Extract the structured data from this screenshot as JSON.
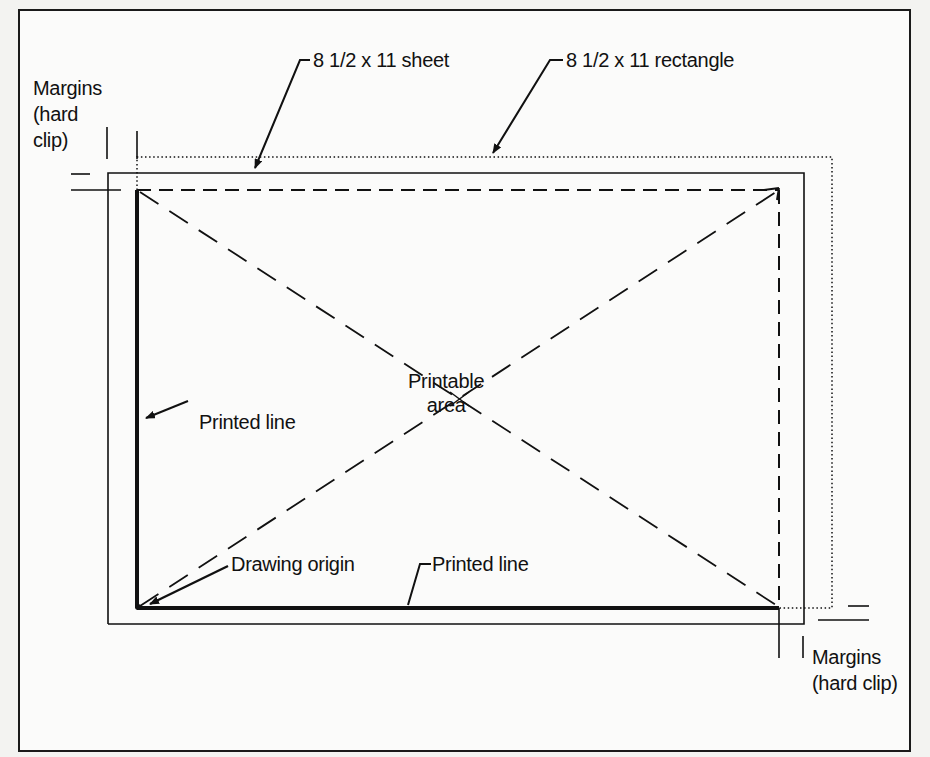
{
  "figure": {
    "type": "printer page layout diagram",
    "labels": {
      "margins_top_left": "Margins\n(hard\nclip)",
      "sheet": "8 1/2 x 11 sheet",
      "rectangle": "8 1/2 x 11 rectangle",
      "printable_area": "Printable\narea",
      "printed_line_left": "Printed line",
      "drawing_origin": "Drawing origin",
      "printed_line_bottom": "Printed line",
      "margins_bottom_right": "Margins\n(hard clip)"
    },
    "elements": [
      {
        "name": "8 1/2 x 11 sheet",
        "style": "thin solid rectangle"
      },
      {
        "name": "8 1/2 x 11 rectangle",
        "style": "dotted rectangle"
      },
      {
        "name": "Printable area",
        "style": "dashed rectangle with dashed diagonals crossing at center"
      },
      {
        "name": "Printed line",
        "style": "thick solid line on left and bottom edges"
      },
      {
        "name": "Drawing origin",
        "style": "point at bottom-left corner of printable area"
      },
      {
        "name": "Margins (hard clip)",
        "style": "tick marks at top-left and bottom-right corners"
      }
    ],
    "colors": {
      "ink": "#111111",
      "paper": "#fbfbfa",
      "background": "#f3f3f1"
    }
  }
}
